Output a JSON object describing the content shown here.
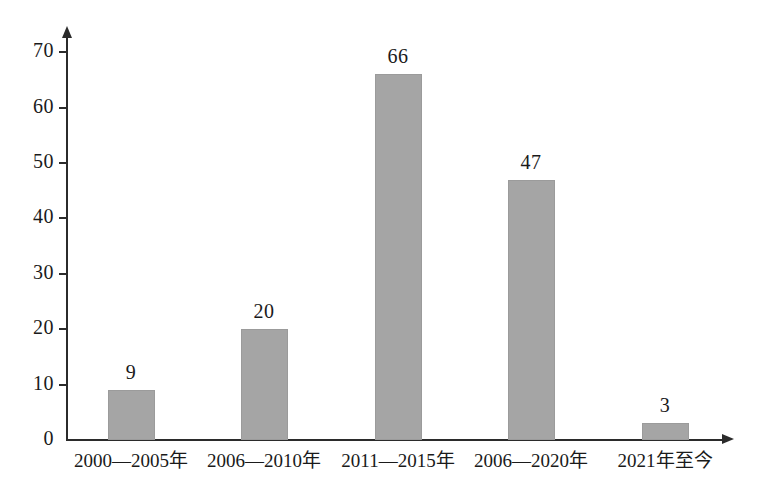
{
  "chart_data": {
    "type": "bar",
    "title": "",
    "subtitle": "",
    "xlabel": "",
    "ylabel": "",
    "categories": [
      "2000—2005年",
      "2006—2010年",
      "2011—2015年",
      "2006—2020年",
      "2021年至今"
    ],
    "values": [
      9,
      20,
      66,
      47,
      3
    ],
    "data_labels": [
      "9",
      "20",
      "66",
      "47",
      "3"
    ],
    "ylim": [
      0,
      70
    ],
    "ytick_labels": [
      "70",
      "60",
      "50",
      "40",
      "30",
      "20",
      "10",
      "0"
    ],
    "ytick_values": [
      70,
      60,
      50,
      40,
      30,
      20,
      10,
      0
    ],
    "ytick_interval": 10,
    "grid": false,
    "legend": false,
    "legend_position": "none",
    "bar_color": "#a5a5a5",
    "axis_color": "#2b2b2b",
    "text_color": "#1a1a1a",
    "background_color": "#ffffff"
  }
}
